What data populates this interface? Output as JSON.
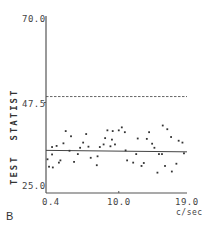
{
  "panel_label": "B",
  "chart_data": {
    "type": "scatter",
    "title": "",
    "xlabel": "c/sec",
    "ylabel": "TEST  STATIST",
    "xlim": [
      0.4,
      19.0
    ],
    "ylim": [
      25.0,
      70.0
    ],
    "x_ticks": [
      "0.4",
      "10.0",
      "19.0"
    ],
    "y_ticks": [
      "70.0",
      "47.5",
      "25.0"
    ],
    "grid": false,
    "reference_lines": [
      {
        "style": "dashed",
        "y": 49.1,
        "label": "threshold"
      },
      {
        "style": "solid",
        "y_start": 34.6,
        "y_end": 34.2,
        "label": "trend"
      }
    ],
    "series": [
      {
        "name": "test statistic",
        "x": [
          0.6,
          0.8,
          1.2,
          1.2,
          1.3,
          1.8,
          2.1,
          2.3,
          2.7,
          3.0,
          3.5,
          3.7,
          4.1,
          4.6,
          4.9,
          5.3,
          5.7,
          6.0,
          6.3,
          7.1,
          7.2,
          7.5,
          8.0,
          8.2,
          8.5,
          8.9,
          9.1,
          9.2,
          9.5,
          10.0,
          10.4,
          10.8,
          10.9,
          11.1,
          11.9,
          12.3,
          12.5,
          13.0,
          13.3,
          13.7,
          14.0,
          14.4,
          14.7,
          15.1,
          15.3,
          15.7,
          15.8,
          16.1,
          16.4,
          16.9,
          17.0,
          17.6,
          17.9,
          18.4,
          18.6
        ],
        "y": [
          32.2,
          30.2,
          35.5,
          33.5,
          30.0,
          35.8,
          31.3,
          31.9,
          36.5,
          39.8,
          34.5,
          38.4,
          31.5,
          33.6,
          35.3,
          36.7,
          39.0,
          35.6,
          32.6,
          30.6,
          33.0,
          35.5,
          36.2,
          37.9,
          40.0,
          35.7,
          37.5,
          39.8,
          36.2,
          40.0,
          40.8,
          39.5,
          34.6,
          31.9,
          31.3,
          33.6,
          37.8,
          30.4,
          31.2,
          37.7,
          39.5,
          36.4,
          35.3,
          28.6,
          33.6,
          33.6,
          41.3,
          30.4,
          40.3,
          38.2,
          28.9,
          31.0,
          37.2,
          36.7,
          33.8
        ]
      }
    ]
  }
}
